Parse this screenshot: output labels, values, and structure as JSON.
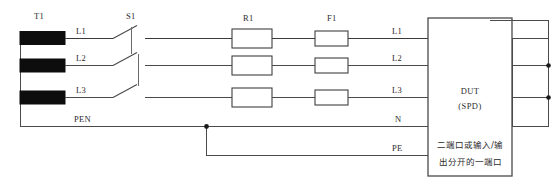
{
  "diagram": {
    "type": "electrical-test-circuit",
    "background_color": "#ffffff",
    "wire_color": "#4a4a4a",
    "winding_color": "#0d0d0d",
    "components": {
      "transformer": {
        "designator": "T1",
        "kind": "three-phase-transformer-windings",
        "winding_count": 3
      },
      "switch": {
        "designator": "S1",
        "kind": "ganged-three-pole-switch",
        "pole_count": 3
      },
      "resistors": {
        "designator": "R1",
        "kind": "resistor",
        "count": 3
      },
      "fuses": {
        "designator": "F1",
        "kind": "fuse",
        "count": 3
      },
      "dut": {
        "title": "DUT",
        "subtitle": "(SPD)",
        "note_line_1": "二端口或输入/输",
        "note_line_2": "出分开的一端口"
      }
    },
    "conductor_labels": {
      "source_side": [
        "L1",
        "L2",
        "L3",
        "PEN"
      ],
      "dut_side": [
        "L1",
        "L2",
        "L3",
        "N",
        "PE"
      ]
    }
  }
}
